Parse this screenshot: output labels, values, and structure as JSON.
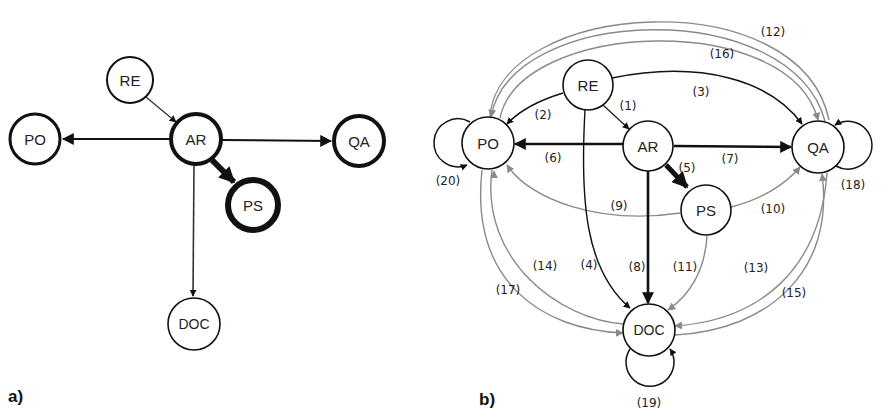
{
  "panels": {
    "a": {
      "label": "a)",
      "nodes": {
        "RE": "RE",
        "AR": "AR",
        "PO": "PO",
        "QA": "QA",
        "PS": "PS",
        "DOC": "DOC"
      },
      "edges": [
        {
          "from": "RE",
          "to": "AR",
          "weight": "thin"
        },
        {
          "from": "AR",
          "to": "PO",
          "weight": "medium"
        },
        {
          "from": "AR",
          "to": "QA",
          "weight": "medium"
        },
        {
          "from": "AR",
          "to": "PS",
          "weight": "thick"
        },
        {
          "from": "AR",
          "to": "DOC",
          "weight": "thin"
        }
      ]
    },
    "b": {
      "label": "b)",
      "nodes": {
        "RE": "RE",
        "AR": "AR",
        "PO": "PO",
        "QA": "QA",
        "PS": "PS",
        "DOC": "DOC"
      },
      "edge_labels": {
        "e1": "(1)",
        "e2": "(2)",
        "e3": "(3)",
        "e4": "(4)",
        "e5": "(5)",
        "e6": "(6)",
        "e7": "(7)",
        "e8": "(8)",
        "e9": "(9)",
        "e10": "(10)",
        "e11": "(11)",
        "e12": "(12)",
        "e13": "(13)",
        "e14": "(14)",
        "e15": "(15)",
        "e16": "(16)",
        "e17": "(17)",
        "e18": "(18)",
        "e19": "(19)",
        "e20": "(20)"
      },
      "edges": [
        {
          "id": 1,
          "from": "RE",
          "to": "AR"
        },
        {
          "id": 2,
          "from": "RE",
          "to": "PO"
        },
        {
          "id": 3,
          "from": "RE",
          "to": "QA"
        },
        {
          "id": 4,
          "from": "RE",
          "to": "DOC"
        },
        {
          "id": 5,
          "from": "AR",
          "to": "PS"
        },
        {
          "id": 6,
          "from": "AR",
          "to": "PO"
        },
        {
          "id": 7,
          "from": "AR",
          "to": "QA"
        },
        {
          "id": 8,
          "from": "AR",
          "to": "DOC"
        },
        {
          "id": 9,
          "from": "PS",
          "to": "PO"
        },
        {
          "id": 10,
          "from": "PS",
          "to": "QA"
        },
        {
          "id": 11,
          "from": "PS",
          "to": "DOC"
        },
        {
          "id": 12,
          "from": "PO",
          "to": "QA"
        },
        {
          "id": 13,
          "from": "QA",
          "to": "DOC"
        },
        {
          "id": 14,
          "from": "PO",
          "to": "DOC"
        },
        {
          "id": 15,
          "from": "DOC",
          "to": "QA"
        },
        {
          "id": 16,
          "from": "QA",
          "to": "PO"
        },
        {
          "id": 17,
          "from": "DOC",
          "to": "PO"
        },
        {
          "id": 18,
          "from": "QA",
          "to": "QA"
        },
        {
          "id": 19,
          "from": "DOC",
          "to": "DOC"
        },
        {
          "id": 20,
          "from": "PO",
          "to": "PO"
        }
      ]
    }
  },
  "colors": {
    "black": "#111111",
    "gray": "#8a8a8a"
  }
}
